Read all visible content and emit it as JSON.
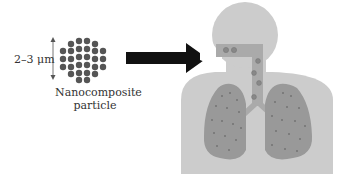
{
  "figure": {
    "size_label": "2–3 μm",
    "particle_label_line1": "Nanocomposite",
    "particle_label_line2": "particle",
    "arrow_direction": "right",
    "target": "human respiratory system (head, trachea, lungs)"
  },
  "particle_cluster": {
    "rows": [
      4,
      6,
      6,
      6,
      6,
      4
    ],
    "dot_color": "#555555"
  },
  "colors": {
    "arrow": "#111111",
    "head_body": "#cccccc",
    "airway": "#aaaaaa",
    "lungs": "#999999",
    "particles_in_airway": "#888888",
    "lung_dots": "#6f6f6f",
    "text": "#333333"
  }
}
